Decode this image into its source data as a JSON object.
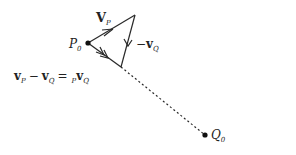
{
  "diagram": {
    "points": {
      "P0": {
        "label": "P",
        "sub": "0",
        "x": 88,
        "y": 43
      },
      "top": {
        "x": 135,
        "y": 15
      },
      "bottom": {
        "x": 121,
        "y": 67
      },
      "Q0": {
        "label": "Q",
        "sub": "0",
        "x": 205,
        "y": 135
      }
    },
    "labels": {
      "vP": {
        "main": "V",
        "sub": "P"
      },
      "negvQ": {
        "minus": "−",
        "main": "v",
        "sub": "Q"
      },
      "equation": {
        "v1": "v",
        "s1": "P",
        "minus": "−",
        "v2": "v",
        "s2": "Q",
        "eq": "=",
        "pre": "P",
        "v3": "v",
        "s3": "Q"
      }
    },
    "colors": {
      "line": "#2a2a2a",
      "text": "#222222"
    }
  }
}
